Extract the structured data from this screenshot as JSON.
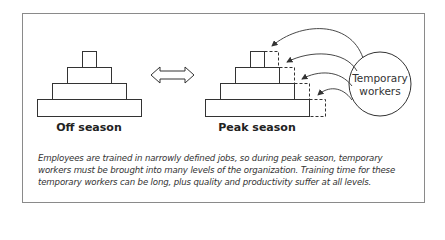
{
  "diagram": {
    "off_season": {
      "label": "Off season",
      "levels": 4
    },
    "peak_season": {
      "label": "Peak season",
      "levels": 4,
      "added_capacity_per_level": "dashed extension"
    },
    "transition_arrow": "double-headed arrow",
    "temporary_workers": {
      "line1": "Temporary",
      "line2": "workers",
      "arrow_count": 4
    },
    "caption": "Employees are trained in narrowly defined jobs, so during peak season, temporary workers must be brought into many levels of the organization. Training time for these temporary workers can be long, plus quality and productivity suffer at all levels.",
    "colors": {
      "stroke": "#333333",
      "frame": "#8a8a8a",
      "background": "#ffffff"
    }
  }
}
